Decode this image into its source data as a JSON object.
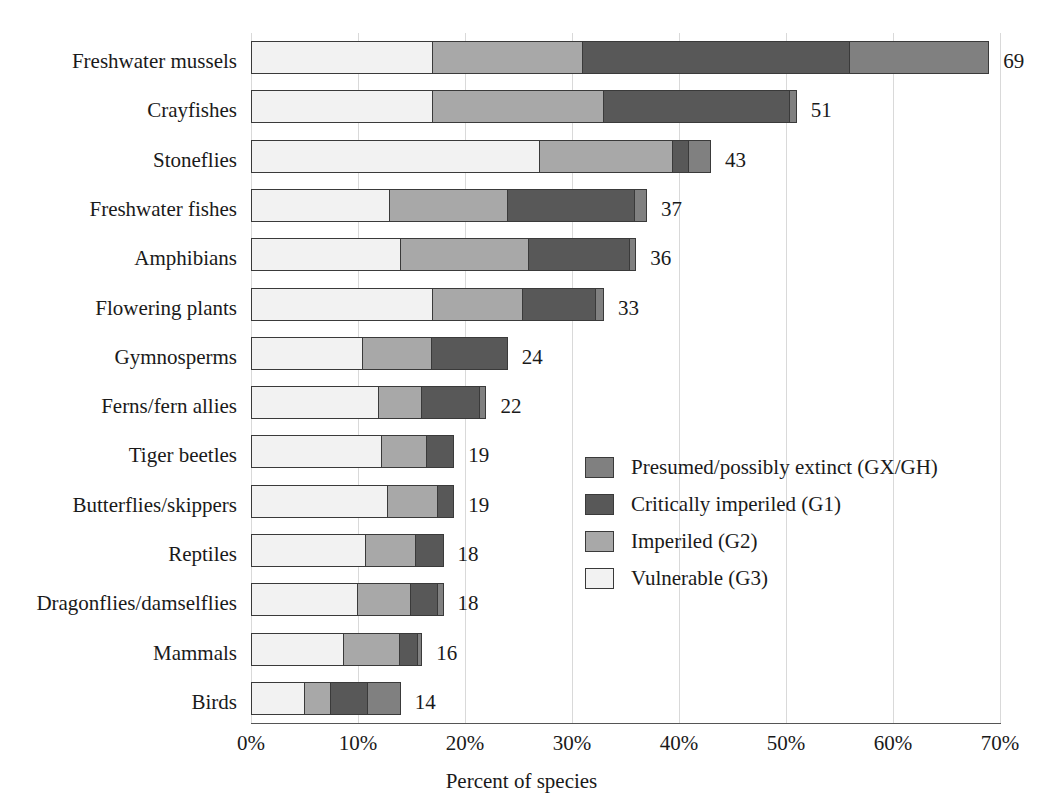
{
  "chart_data": {
    "type": "bar",
    "orientation": "horizontal",
    "stacked": true,
    "title": "",
    "subtitle": "",
    "xlabel": "Percent of species",
    "ylabel": "",
    "xlim": [
      0,
      70
    ],
    "xticks": [
      0,
      10,
      20,
      30,
      40,
      50,
      60,
      70
    ],
    "xticklabels": [
      "0%",
      "10%",
      "20%",
      "30%",
      "40%",
      "50%",
      "60%",
      "70%"
    ],
    "grid": "vertical",
    "legend_position": "inside-center-right",
    "categories": [
      "Freshwater mussels",
      "Crayfishes",
      "Stoneflies",
      "Freshwater fishes",
      "Amphibians",
      "Flowering plants",
      "Gymnosperms",
      "Ferns/fern allies",
      "Tiger beetles",
      "Butterflies/skippers",
      "Reptiles",
      "Dragonflies/damselflies",
      "Mammals",
      "Birds"
    ],
    "series": [
      {
        "name": "Vulnerable (G3)",
        "color": "#f2f2f2",
        "values": [
          17.0,
          17.0,
          27.0,
          13.0,
          14.0,
          17.0,
          10.5,
          12.0,
          12.3,
          12.8,
          10.8,
          10.0,
          8.7,
          5.0
        ]
      },
      {
        "name": "Imperiled (G2)",
        "color": "#a8a8a8",
        "values": [
          14.0,
          16.0,
          12.5,
          11.0,
          12.0,
          8.5,
          6.5,
          4.0,
          4.2,
          4.8,
          4.7,
          5.0,
          5.3,
          2.5
        ]
      },
      {
        "name": "Critically imperiled (G1)",
        "color": "#585858",
        "values": [
          25.0,
          17.5,
          1.5,
          12.0,
          9.5,
          6.8,
          7.0,
          5.5,
          2.5,
          1.4,
          2.5,
          2.6,
          1.7,
          3.5
        ]
      },
      {
        "name": "Presumed/possibly extinct (GX/GH)",
        "color": "#808080",
        "values": [
          13.0,
          0.5,
          2.0,
          1.0,
          0.5,
          0.7,
          0.0,
          0.5,
          0.0,
          0.0,
          0.0,
          0.4,
          0.3,
          3.0
        ]
      }
    ],
    "totals": [
      69,
      51,
      43,
      37,
      36,
      33,
      24,
      22,
      19,
      19,
      18,
      18,
      16,
      14
    ],
    "value_labels": [
      "69",
      "51",
      "43",
      "37",
      "36",
      "33",
      "24",
      "22",
      "19",
      "19",
      "18",
      "18",
      "16",
      "14"
    ]
  },
  "legend": {
    "items": [
      {
        "label": "Presumed/possibly extinct (GX/GH)",
        "color": "#808080"
      },
      {
        "label": "Critically imperiled (G1)",
        "color": "#585858"
      },
      {
        "label": "Imperiled (G2)",
        "color": "#a8a8a8"
      },
      {
        "label": "Vulnerable (G3)",
        "color": "#f2f2f2"
      }
    ]
  }
}
